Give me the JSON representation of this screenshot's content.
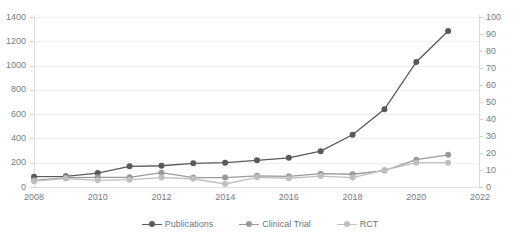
{
  "chart_data": {
    "type": "line",
    "title": "",
    "xlabel": "",
    "ylabel": "",
    "x": [
      2008,
      2009,
      2010,
      2011,
      2012,
      2013,
      2014,
      2015,
      2016,
      2017,
      2018,
      2019,
      2020,
      2021
    ],
    "series": [
      {
        "name": "Publications",
        "color": "#595959",
        "axis": "left",
        "values": [
          85,
          88,
          115,
          170,
          175,
          195,
          200,
          220,
          240,
          295,
          430,
          640,
          1030,
          1285
        ]
      },
      {
        "name": "Clinical Trial",
        "color": "#9a9a9a",
        "axis": "left",
        "values": [
          55,
          78,
          80,
          80,
          118,
          78,
          78,
          92,
          88,
          110,
          105,
          135,
          225,
          265
        ]
      },
      {
        "name": "RCT",
        "color": "#bfbfbf",
        "axis": "left",
        "values": [
          48,
          70,
          55,
          60,
          78,
          68,
          25,
          80,
          72,
          90,
          78,
          140,
          200,
          200
        ]
      }
    ],
    "axes": {
      "left": {
        "min": 0,
        "max": 1400,
        "ticks": [
          0,
          200,
          400,
          600,
          800,
          1000,
          1200,
          1400
        ],
        "tick_labels": [
          "0",
          "200",
          "400",
          "600",
          "800",
          "1000",
          "1200",
          "1400"
        ]
      },
      "right": {
        "min": 0,
        "max": 100,
        "ticks": [
          0,
          10,
          20,
          30,
          40,
          50,
          60,
          70,
          80,
          90,
          100
        ],
        "tick_labels": [
          "0",
          "10",
          "20",
          "30",
          "40",
          "50",
          "60",
          "70",
          "80",
          "90",
          "100"
        ]
      },
      "bottom": {
        "min": 2008,
        "max": 2022,
        "ticks": [
          2008,
          2010,
          2012,
          2014,
          2016,
          2018,
          2020,
          2022
        ],
        "tick_labels": [
          "2008",
          "2010",
          "2012",
          "2014",
          "2016",
          "2018",
          "2020",
          "2022"
        ]
      }
    },
    "grid": true,
    "legend_position": "bottom"
  },
  "legend": {
    "items": [
      {
        "label": "Publications",
        "color": "#595959"
      },
      {
        "label": "Clinical Trial",
        "color": "#9a9a9a"
      },
      {
        "label": "RCT",
        "color": "#bfbfbf"
      }
    ]
  }
}
